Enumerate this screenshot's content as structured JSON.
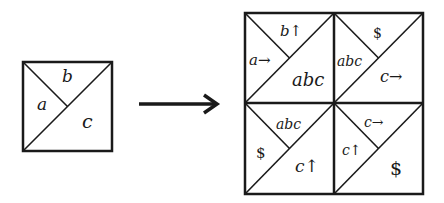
{
  "source_tile": {
    "labels": {
      "left": "a",
      "top": "b",
      "bottom_right": "c"
    }
  },
  "arrow": {
    "direction": "right"
  },
  "result_grid": {
    "tiles": [
      {
        "position": "top-left",
        "left": "a→",
        "top": "b↑",
        "bottom_right": "abc"
      },
      {
        "position": "top-right",
        "left": "abc",
        "top": "$",
        "bottom_right": "c→"
      },
      {
        "position": "bottom-left",
        "left": "$",
        "top": "abc",
        "bottom_right": "c↑"
      },
      {
        "position": "bottom-right",
        "left": "c↑",
        "top": "c→",
        "bottom_right": "$"
      }
    ]
  },
  "colors": {
    "stroke": "#1a1a1a",
    "background": "#ffffff"
  }
}
